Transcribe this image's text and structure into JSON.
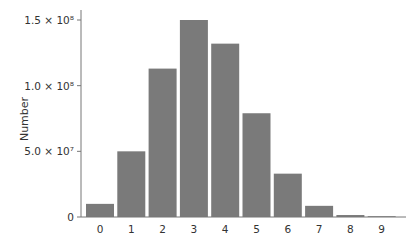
{
  "chart_data": {
    "type": "bar",
    "title": "",
    "xlabel": "",
    "ylabel": "Number",
    "categories": [
      "0",
      "1",
      "2",
      "3",
      "4",
      "5",
      "6",
      "7",
      "8",
      "9"
    ],
    "values": [
      10000000,
      50000000,
      113000000,
      150000000,
      132000000,
      79000000,
      33000000,
      8500000,
      1500000,
      300000
    ],
    "ylim": [
      0,
      160000000
    ],
    "yticks": [
      0,
      50000000,
      100000000,
      150000000
    ],
    "ytick_labels": [
      "0",
      "5.0 × 10⁷",
      "1.0 × 10⁸",
      "1.5 × 10⁸"
    ],
    "grid": false,
    "legend": null,
    "bar_color": "#7a7a7a"
  }
}
